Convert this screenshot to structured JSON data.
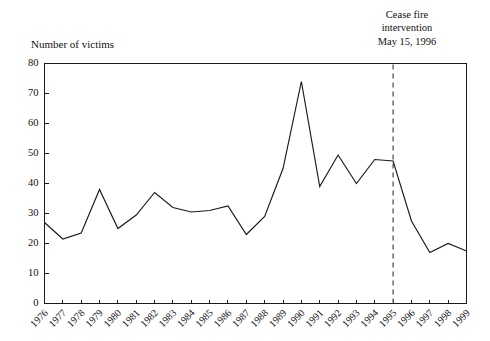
{
  "chart_data": {
    "type": "line",
    "title": "",
    "xlabel": "",
    "ylabel": "Number of victims",
    "categories": [
      "1976",
      "1977",
      "1978",
      "1979",
      "1980",
      "1981",
      "1982",
      "1983",
      "1984",
      "1985",
      "1986",
      "1987",
      "1988",
      "1989",
      "1990",
      "1991",
      "1992",
      "1993",
      "1994",
      "1995",
      "1996",
      "1997",
      "1998",
      "1999"
    ],
    "values": [
      27,
      21.5,
      23.5,
      38,
      25,
      29.5,
      37,
      32,
      30.5,
      31,
      32.5,
      23,
      29,
      45,
      74,
      39,
      49.5,
      40,
      48,
      47.5,
      27.5,
      17,
      20,
      17.5
    ],
    "series": [
      {
        "name": "Number of victims",
        "values": [
          27,
          21.5,
          23.5,
          38,
          25,
          29.5,
          37,
          32,
          30.5,
          31,
          32.5,
          23,
          29,
          45,
          74,
          39,
          49.5,
          40,
          48,
          47.5,
          27.5,
          17,
          20,
          17.5
        ]
      }
    ],
    "ylim": [
      0,
      80
    ],
    "ytick_values": [
      0,
      10,
      20,
      30,
      40,
      50,
      60,
      70,
      80
    ],
    "ytick_labels": [
      "0",
      "10",
      "20",
      "30",
      "40",
      "50",
      "60",
      "70",
      "80"
    ],
    "xlim": [
      "1976",
      "1999"
    ],
    "grid": false,
    "legend": false,
    "legend_position": "none",
    "annotations": [
      {
        "name": "cease-fire-event",
        "lines": [
          "Cease fire",
          "intervention",
          "May 15, 1996"
        ],
        "line1": "Cease fire",
        "line2": "intervention",
        "line3": "May 15, 1996",
        "marker_type": "dashed-vertical-line",
        "marker_x_category": "1995"
      }
    ],
    "colors": {
      "line": "#1a1a1a",
      "axis": "#1a1a1a",
      "event_marker": "#555555",
      "background": "#ffffff"
    }
  }
}
